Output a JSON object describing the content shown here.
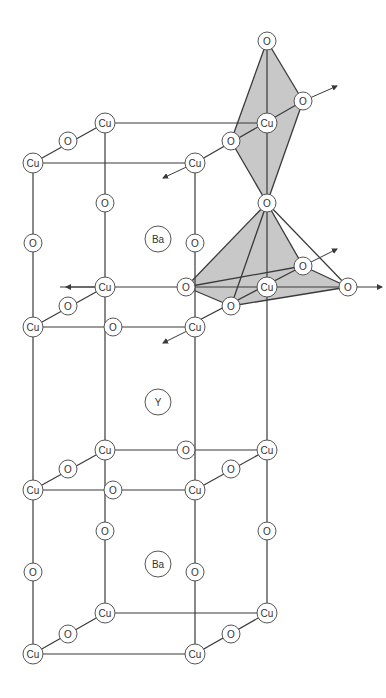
{
  "colors": {
    "line": "#3a3a3a",
    "polyhedron_fill": "#c8c8c8",
    "atom_fill": "#ffffff",
    "atom_stroke": "#555555"
  },
  "atoms": [
    {
      "id": "o1",
      "el": "O",
      "x": 267,
      "y": 41,
      "r": 9
    },
    {
      "id": "o2",
      "el": "O",
      "x": 303,
      "y": 101,
      "r": 9
    },
    {
      "id": "cu1",
      "el": "Cu",
      "x": 105,
      "y": 123,
      "r": 10
    },
    {
      "id": "cu2",
      "el": "Cu",
      "x": 267,
      "y": 123,
      "r": 10
    },
    {
      "id": "o3",
      "el": "O",
      "x": 68,
      "y": 141,
      "r": 9
    },
    {
      "id": "o4",
      "el": "O",
      "x": 231,
      "y": 141,
      "r": 9
    },
    {
      "id": "cu3",
      "el": "Cu",
      "x": 33,
      "y": 163,
      "r": 10
    },
    {
      "id": "cu4",
      "el": "Cu",
      "x": 195,
      "y": 163,
      "r": 10
    },
    {
      "id": "o5",
      "el": "O",
      "x": 105,
      "y": 203,
      "r": 9
    },
    {
      "id": "o6",
      "el": "O",
      "x": 267,
      "y": 203,
      "r": 9
    },
    {
      "id": "ba1",
      "el": "Ba",
      "x": 158,
      "y": 239,
      "r": 13
    },
    {
      "id": "o7",
      "el": "O",
      "x": 33,
      "y": 243,
      "r": 9
    },
    {
      "id": "o8",
      "el": "O",
      "x": 195,
      "y": 243,
      "r": 9
    },
    {
      "id": "o9",
      "el": "O",
      "x": 303,
      "y": 266,
      "r": 9
    },
    {
      "id": "cu5",
      "el": "Cu",
      "x": 105,
      "y": 287,
      "r": 10
    },
    {
      "id": "o10",
      "el": "O",
      "x": 186,
      "y": 287,
      "r": 9
    },
    {
      "id": "cu6",
      "el": "Cu",
      "x": 267,
      "y": 287,
      "r": 10
    },
    {
      "id": "o11",
      "el": "O",
      "x": 348,
      "y": 287,
      "r": 9
    },
    {
      "id": "o12",
      "el": "O",
      "x": 68,
      "y": 306,
      "r": 9
    },
    {
      "id": "o13",
      "el": "O",
      "x": 231,
      "y": 306,
      "r": 9
    },
    {
      "id": "cu7",
      "el": "Cu",
      "x": 33,
      "y": 327,
      "r": 10
    },
    {
      "id": "o14",
      "el": "O",
      "x": 113,
      "y": 327,
      "r": 9
    },
    {
      "id": "cu8",
      "el": "Cu",
      "x": 195,
      "y": 327,
      "r": 10
    },
    {
      "id": "y1",
      "el": "Y",
      "x": 158,
      "y": 402,
      "r": 13
    },
    {
      "id": "cu9",
      "el": "Cu",
      "x": 105,
      "y": 450,
      "r": 10
    },
    {
      "id": "o15",
      "el": "O",
      "x": 186,
      "y": 450,
      "r": 9
    },
    {
      "id": "cu10",
      "el": "Cu",
      "x": 267,
      "y": 450,
      "r": 10
    },
    {
      "id": "o16",
      "el": "O",
      "x": 68,
      "y": 469,
      "r": 9
    },
    {
      "id": "o17",
      "el": "O",
      "x": 231,
      "y": 469,
      "r": 9
    },
    {
      "id": "cu11",
      "el": "Cu",
      "x": 33,
      "y": 490,
      "r": 10
    },
    {
      "id": "o18",
      "el": "O",
      "x": 113,
      "y": 490,
      "r": 9
    },
    {
      "id": "cu12",
      "el": "Cu",
      "x": 195,
      "y": 490,
      "r": 10
    },
    {
      "id": "o19",
      "el": "O",
      "x": 105,
      "y": 531,
      "r": 9
    },
    {
      "id": "o20",
      "el": "O",
      "x": 267,
      "y": 531,
      "r": 9
    },
    {
      "id": "ba2",
      "el": "Ba",
      "x": 158,
      "y": 564,
      "r": 13
    },
    {
      "id": "o21",
      "el": "O",
      "x": 33,
      "y": 572,
      "r": 9
    },
    {
      "id": "o22",
      "el": "O",
      "x": 195,
      "y": 572,
      "r": 9
    },
    {
      "id": "cu13",
      "el": "Cu",
      "x": 105,
      "y": 613,
      "r": 10
    },
    {
      "id": "cu14",
      "el": "Cu",
      "x": 267,
      "y": 613,
      "r": 10
    },
    {
      "id": "o23",
      "el": "O",
      "x": 68,
      "y": 634,
      "r": 9
    },
    {
      "id": "o24",
      "el": "O",
      "x": 231,
      "y": 634,
      "r": 9
    },
    {
      "id": "cu15",
      "el": "Cu",
      "x": 33,
      "y": 654,
      "r": 10
    },
    {
      "id": "cu16",
      "el": "Cu",
      "x": 195,
      "y": 654,
      "r": 10
    }
  ],
  "bonds": [
    [
      105,
      123,
      267,
      123
    ],
    [
      33,
      163,
      195,
      163
    ],
    [
      33,
      163,
      105,
      123
    ],
    [
      195,
      163,
      303,
      101
    ],
    [
      33,
      163,
      33,
      654
    ],
    [
      105,
      123,
      105,
      613
    ],
    [
      195,
      163,
      195,
      654
    ],
    [
      267,
      41,
      267,
      613
    ],
    [
      60,
      287,
      348,
      287
    ],
    [
      33,
      327,
      195,
      327
    ],
    [
      33,
      327,
      105,
      287
    ],
    [
      186,
      327,
      303,
      266
    ],
    [
      105,
      450,
      267,
      450
    ],
    [
      33,
      490,
      195,
      490
    ],
    [
      33,
      490,
      105,
      450
    ],
    [
      195,
      490,
      267,
      450
    ],
    [
      105,
      613,
      267,
      613
    ],
    [
      33,
      654,
      195,
      654
    ],
    [
      33,
      654,
      105,
      613
    ],
    [
      195,
      654,
      267,
      613
    ]
  ],
  "octahedron": {
    "faces": [
      "267,41 231,141 267,203 303,101"
    ],
    "edges": [
      [
        267,
        41,
        231,
        141
      ],
      [
        267,
        41,
        303,
        101
      ],
      [
        231,
        141,
        267,
        203
      ],
      [
        303,
        101,
        267,
        203
      ]
    ]
  },
  "pyramid": {
    "faces": [
      "267,203 186,287 231,306 348,287 303,266"
    ],
    "edges": [
      [
        267,
        203,
        186,
        287
      ],
      [
        267,
        203,
        231,
        306
      ],
      [
        267,
        203,
        303,
        266
      ],
      [
        267,
        203,
        348,
        287
      ],
      [
        186,
        287,
        303,
        266
      ],
      [
        186,
        287,
        231,
        306
      ],
      [
        231,
        306,
        348,
        287
      ],
      [
        303,
        266,
        348,
        287
      ]
    ]
  },
  "arrows": [
    {
      "x1": 303,
      "y1": 101,
      "x2": 337,
      "y2": 86
    },
    {
      "x1": 195,
      "y1": 163,
      "x2": 163,
      "y2": 178
    },
    {
      "x1": 303,
      "y1": 266,
      "x2": 337,
      "y2": 249
    },
    {
      "x1": 348,
      "y1": 287,
      "x2": 382,
      "y2": 287
    },
    {
      "x1": 105,
      "y1": 287,
      "x2": 66,
      "y2": 287
    },
    {
      "x1": 195,
      "y1": 327,
      "x2": 163,
      "y2": 343
    }
  ]
}
